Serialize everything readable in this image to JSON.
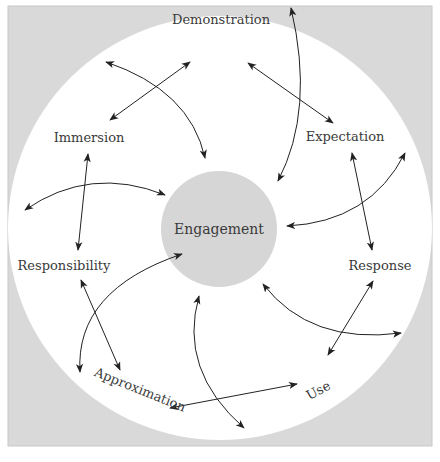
{
  "colors": {
    "frame_fill": "#d9d9d9",
    "frame_border": "#c8c8c8",
    "ring_fill": "#ffffff",
    "center_fill": "#d6d6d6",
    "arrow": "#222222",
    "label": "#3a3a3a"
  },
  "diagram": {
    "center_label": "Engagement",
    "nodes": [
      {
        "id": "demonstration",
        "label": "Demonstration"
      },
      {
        "id": "expectation",
        "label": "Expectation"
      },
      {
        "id": "response",
        "label": "Response"
      },
      {
        "id": "use",
        "label": "Use"
      },
      {
        "id": "approximation",
        "label": "Approximation"
      },
      {
        "id": "responsibility",
        "label": "Responsibility"
      },
      {
        "id": "immersion",
        "label": "Immersion"
      }
    ],
    "edges": [
      {
        "from": "immersion",
        "to": "demonstration",
        "type": "bidirectional"
      },
      {
        "from": "demonstration",
        "to": "expectation",
        "type": "bidirectional"
      },
      {
        "from": "expectation",
        "to": "response",
        "type": "bidirectional"
      },
      {
        "from": "response",
        "to": "use",
        "type": "bidirectional"
      },
      {
        "from": "use",
        "to": "approximation",
        "type": "bidirectional"
      },
      {
        "from": "approximation",
        "to": "responsibility",
        "type": "bidirectional"
      },
      {
        "from": "responsibility",
        "to": "immersion",
        "type": "bidirectional"
      },
      {
        "from": "outer-ring",
        "to": "engagement",
        "type": "bidirectional-arc",
        "count": 7
      }
    ]
  },
  "caption": {
    "text": ""
  }
}
